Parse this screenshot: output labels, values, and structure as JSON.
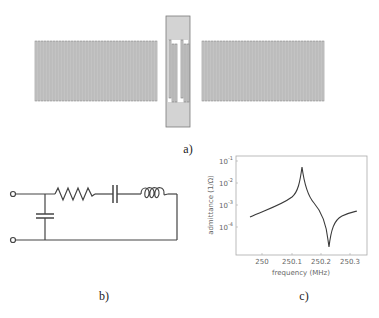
{
  "panels": {
    "a": {
      "label": "a)",
      "description": "SAW resonator layout: two reflector gratings with central interdigital transducer"
    },
    "b": {
      "label": "b)",
      "description": "Equivalent circuit: shunt capacitor in parallel with series R-C-L branch"
    },
    "c": {
      "label": "c)"
    }
  },
  "colors": {
    "metal_fill": "#d3d3d3",
    "metal_stroke": "#7a7a7a",
    "line": "#444444",
    "curve": "#3a3a3a",
    "axis": "#aaaaaa"
  },
  "chart_data": {
    "type": "line",
    "title": "",
    "xlabel": "frequency (MHz)",
    "ylabel": "admittance (1/Ω)",
    "x_ticks": [
      "250",
      "250.1",
      "250.2",
      "250.3"
    ],
    "y_ticks": [
      "10^-1",
      "10^-2",
      "10^-3",
      "10^-4"
    ],
    "y_scale": "log",
    "xlim": [
      249.97,
      250.32
    ],
    "ylim": [
      5e-06,
      0.2
    ],
    "series": [
      {
        "name": "admittance",
        "x": [
          249.98,
          250.0,
          250.02,
          250.04,
          250.06,
          250.08,
          250.09,
          250.1,
          250.105,
          250.11,
          250.13,
          250.15,
          250.17,
          250.19,
          250.2,
          250.21,
          250.23,
          250.25,
          250.28,
          250.3
        ],
        "y": [
          0.0004,
          0.0006,
          0.0008,
          0.0011,
          0.0016,
          0.003,
          0.006,
          0.02,
          0.09,
          0.015,
          0.004,
          0.002,
          0.001,
          0.0003,
          2e-05,
          0.0002,
          0.0005,
          0.0007,
          0.0009,
          0.001
        ]
      }
    ],
    "features": {
      "resonance_peak_MHz": 250.105,
      "antiresonance_MHz": 250.2
    },
    "grid": false
  }
}
